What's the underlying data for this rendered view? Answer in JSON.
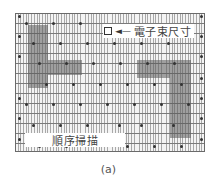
{
  "figure": {
    "caption": "(a)",
    "grid": {
      "description": "Raster scan grid with dense vertical lines and horizontal scan rows",
      "line_color": "#7a7a7a",
      "background": "#f4f4f4"
    },
    "shaded_regions_color": "#5a5a5a",
    "labels": {
      "beam_size": "電子束尺寸",
      "beam_arrow": "◄—",
      "sequential_scan": "順序掃描"
    }
  }
}
